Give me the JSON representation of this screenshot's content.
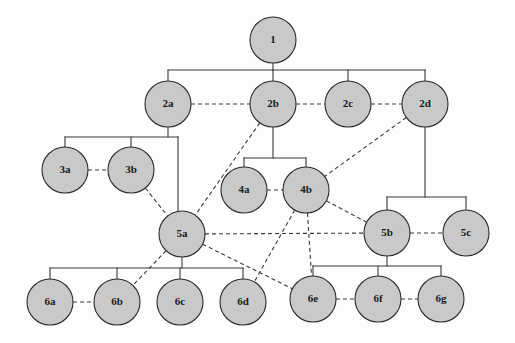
{
  "diagram": {
    "type": "tree-with-lateral-links",
    "node_fill_color": "#c9c9c9",
    "node_stroke_color": "#2b2b2b",
    "edge_color": "#3a3a3a",
    "background_color": "#fdfdfd",
    "node_radius": 23,
    "levels": [
      {
        "name": "level-1",
        "labels": [
          "1"
        ]
      },
      {
        "name": "level-2",
        "labels": [
          "2a",
          "2b",
          "2c",
          "2d"
        ]
      },
      {
        "name": "level-3",
        "labels": [
          "3a",
          "3b"
        ]
      },
      {
        "name": "level-4",
        "labels": [
          "4a",
          "4b"
        ]
      },
      {
        "name": "level-5",
        "labels": [
          "5a",
          "5b",
          "5c"
        ]
      },
      {
        "name": "level-6",
        "labels": [
          "6a",
          "6b",
          "6c",
          "6d",
          "6e",
          "6f",
          "6g"
        ]
      }
    ],
    "nodes": [
      {
        "id": "1",
        "label": "1",
        "cx": 273,
        "cy": 40,
        "r": 23
      },
      {
        "id": "2a",
        "label": "2a",
        "cx": 168,
        "cy": 104,
        "r": 23
      },
      {
        "id": "2b",
        "label": "2b",
        "cx": 273,
        "cy": 104,
        "r": 23
      },
      {
        "id": "2c",
        "label": "2c",
        "cx": 348,
        "cy": 104,
        "r": 23
      },
      {
        "id": "2d",
        "label": "2d",
        "cx": 425,
        "cy": 104,
        "r": 23
      },
      {
        "id": "3a",
        "label": "3a",
        "cx": 65,
        "cy": 170,
        "r": 23
      },
      {
        "id": "3b",
        "label": "3b",
        "cx": 131,
        "cy": 170,
        "r": 23
      },
      {
        "id": "4a",
        "label": "4a",
        "cx": 244,
        "cy": 190,
        "r": 23
      },
      {
        "id": "4b",
        "label": "4b",
        "cx": 306,
        "cy": 190,
        "r": 23
      },
      {
        "id": "5a",
        "label": "5a",
        "cx": 182,
        "cy": 234,
        "r": 23
      },
      {
        "id": "5b",
        "label": "5b",
        "cx": 387,
        "cy": 233,
        "r": 23
      },
      {
        "id": "5c",
        "label": "5c",
        "cx": 466,
        "cy": 233,
        "r": 23
      },
      {
        "id": "6a",
        "label": "6a",
        "cx": 50,
        "cy": 302,
        "r": 23
      },
      {
        "id": "6b",
        "label": "6b",
        "cx": 117,
        "cy": 302,
        "r": 23
      },
      {
        "id": "6c",
        "label": "6c",
        "cx": 180,
        "cy": 302,
        "r": 23
      },
      {
        "id": "6d",
        "label": "6d",
        "cx": 243,
        "cy": 302,
        "r": 23
      },
      {
        "id": "6e",
        "label": "6e",
        "cx": 313,
        "cy": 299,
        "r": 23
      },
      {
        "id": "6f",
        "label": "6f",
        "cx": 378,
        "cy": 299,
        "r": 23
      },
      {
        "id": "6g",
        "label": "6g",
        "cx": 441,
        "cy": 299,
        "r": 23
      }
    ],
    "bus_edges": [
      {
        "id": "bus-1-children",
        "parent": "1",
        "stem_x": 273,
        "bus_y": 70,
        "from_y": 63,
        "left_x": 168,
        "right_x": 425,
        "drops": [
          168,
          273,
          348,
          425
        ],
        "drop_to_y": 81,
        "children": [
          "2a",
          "2b",
          "2c",
          "2d"
        ]
      },
      {
        "id": "bus-2a-children",
        "parent": "2a",
        "stem_x": 168,
        "bus_y": 137,
        "from_y": 127,
        "left_x": 65,
        "right_x": 178,
        "drops": [
          65,
          131
        ],
        "drop_to_y": 147,
        "children": [
          "3a",
          "3b"
        ]
      },
      {
        "id": "bus-2b-children",
        "parent": "2b",
        "stem_x": 273,
        "bus_y": 158,
        "from_y": 127,
        "left_x": 244,
        "right_x": 306,
        "drops": [
          244,
          306
        ],
        "drop_to_y": 167,
        "children": [
          "4a",
          "4b"
        ]
      },
      {
        "id": "bus-2d-children",
        "parent": "2d",
        "stem_x": 425,
        "bus_y": 197,
        "from_y": 127,
        "left_x": 387,
        "right_x": 466,
        "drops": [
          387,
          466
        ],
        "drop_to_y": 210,
        "children": [
          "5b",
          "5c"
        ]
      },
      {
        "id": "bus-5a-children",
        "parent": "5a",
        "stem_x": 182,
        "bus_y": 268,
        "from_y": 257,
        "left_x": 50,
        "right_x": 243,
        "drops": [
          50,
          117,
          180,
          243
        ],
        "drop_to_y": 279,
        "children": [
          "6a",
          "6b",
          "6c",
          "6d"
        ]
      },
      {
        "id": "bus-5b-children",
        "parent": "5b",
        "stem_x": 387,
        "bus_y": 266,
        "from_y": 256,
        "left_x": 313,
        "right_x": 441,
        "drops": [
          313,
          378,
          441
        ],
        "drop_to_y": 276,
        "children": [
          "6e",
          "6f",
          "6g"
        ]
      }
    ],
    "vertical_edges": [
      {
        "id": "edge-2a-5a",
        "from": "2a",
        "to": "5a",
        "x": 178,
        "y1": 137,
        "y2": 215
      }
    ],
    "dashed_edges": [
      {
        "id": "link-2a-2b",
        "from": "2a",
        "to": "2b"
      },
      {
        "id": "link-2b-2c",
        "from": "2b",
        "to": "2c"
      },
      {
        "id": "link-2c-2d",
        "from": "2c",
        "to": "2d"
      },
      {
        "id": "link-3a-3b",
        "from": "3a",
        "to": "3b"
      },
      {
        "id": "link-4a-4b",
        "from": "4a",
        "to": "4b"
      },
      {
        "id": "link-2b-5a",
        "from": "2b",
        "to": "5a"
      },
      {
        "id": "link-2d-4b",
        "from": "2d",
        "to": "4b"
      },
      {
        "id": "link-3b-5a",
        "from": "3b",
        "to": "5a"
      },
      {
        "id": "link-5a-5b",
        "from": "5a",
        "to": "5b"
      },
      {
        "id": "link-5b-5c",
        "from": "5b",
        "to": "5c"
      },
      {
        "id": "link-4b-5b",
        "from": "4b",
        "to": "5b"
      },
      {
        "id": "link-4b-6e",
        "from": "4b",
        "to": "6e"
      },
      {
        "id": "link-4b-6d",
        "from": "4b",
        "to": "6d"
      },
      {
        "id": "link-5a-6b",
        "from": "5a",
        "to": "6b"
      },
      {
        "id": "link-5a-6e",
        "from": "5a",
        "to": "6e"
      },
      {
        "id": "link-6a-6b",
        "from": "6a",
        "to": "6b"
      },
      {
        "id": "link-6e-6f",
        "from": "6e",
        "to": "6f"
      },
      {
        "id": "link-6f-6g",
        "from": "6f",
        "to": "6g"
      }
    ]
  }
}
